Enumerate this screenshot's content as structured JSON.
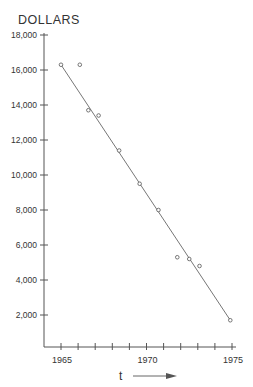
{
  "chart_data": {
    "type": "scatter",
    "title": "",
    "ylabel": "DOLLARS",
    "xlabel": "t",
    "xlim": [
      1964,
      1975.5
    ],
    "ylim": [
      0,
      18000
    ],
    "grid": false,
    "legend": null,
    "y_ticks": [
      2000,
      4000,
      6000,
      8000,
      10000,
      12000,
      14000,
      16000,
      18000
    ],
    "y_tick_labels": [
      "2,000",
      "4,000",
      "6,000",
      "8,000",
      "10,000",
      "12,000",
      "14,000",
      "16,000",
      "18,000"
    ],
    "x_ticks": [
      1965,
      1966,
      1967,
      1968,
      1969,
      1970,
      1971,
      1972,
      1973,
      1974,
      1975
    ],
    "x_tick_labels": [
      "1965",
      "",
      "",
      "",
      "",
      "1970",
      "",
      "",
      "",
      "",
      "1975"
    ],
    "series": [
      {
        "name": "observed",
        "marker": "open-circle",
        "x": [
          1965.0,
          1966.1,
          1966.6,
          1967.2,
          1968.4,
          1969.6,
          1970.7,
          1971.8,
          1972.5,
          1973.1,
          1974.9
        ],
        "y": [
          16300,
          16300,
          13700,
          13400,
          11400,
          9500,
          8000,
          5300,
          5200,
          4800,
          1700
        ]
      },
      {
        "name": "trend line",
        "style": "line",
        "x": [
          1965.0,
          1974.9
        ],
        "y": [
          16300,
          1700
        ]
      }
    ],
    "annotations": [
      "t →  (time arrow along x-axis)"
    ]
  },
  "labels": {
    "y_title": "DOLLARS",
    "x_title": "t"
  }
}
